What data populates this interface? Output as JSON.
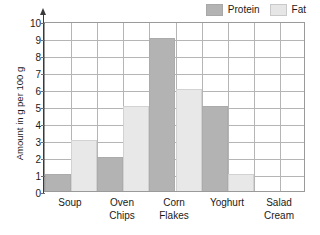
{
  "chart_data": {
    "type": "bar",
    "title": "",
    "xlabel": "",
    "ylabel": "Amount in g per 100 g",
    "categories": [
      "Soup",
      "Oven Chips",
      "Corn Flakes",
      "Yoghurt",
      "Salad Cream"
    ],
    "category_lines": [
      [
        "Soup"
      ],
      [
        "Oven",
        "Chips"
      ],
      [
        "Corn",
        "Flakes"
      ],
      [
        "Yoghurt"
      ],
      [
        "Salad",
        "Cream"
      ]
    ],
    "series": [
      {
        "name": "Protein",
        "values": [
          1,
          2,
          9,
          5,
          0
        ],
        "color": "#b3b3b3"
      },
      {
        "name": "Fat",
        "values": [
          3,
          5,
          6,
          1,
          0
        ],
        "color": "#e8e8e8"
      }
    ],
    "ylim": [
      0,
      10
    ],
    "ytick_labels": [
      "0",
      "1",
      "2",
      "3",
      "4",
      "5",
      "6",
      "7",
      "8",
      "9",
      "10"
    ],
    "ytick_values": [
      0,
      1,
      2,
      3,
      4,
      5,
      6,
      7,
      8,
      9,
      10
    ],
    "grid": true,
    "legend_position": "top-right"
  },
  "legend": {
    "entries": [
      {
        "label": "Protein",
        "swatch": "protein-swatch"
      },
      {
        "label": "Fat",
        "swatch": "fat-swatch"
      }
    ]
  },
  "axes": {
    "y_title": "Amount in g per 100 g"
  }
}
